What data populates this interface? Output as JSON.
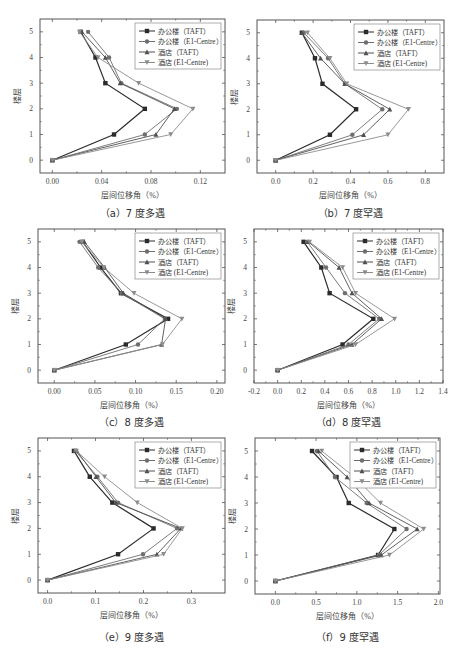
{
  "series_names": [
    "办公楼（TAFT）",
    "办公楼（E1-Centre）",
    "酒店（TAFT）",
    "酒店 (E1-Centre)"
  ],
  "series_colors": [
    "#2b2b2b",
    "#6e6e6e",
    "#505050",
    "#8c8c8c"
  ],
  "series_markers": [
    "square",
    "circle",
    "triangle-up",
    "triangle-down"
  ],
  "chart_data": [
    {
      "id": "a",
      "type": "line",
      "caption": "（a）7 度多遇",
      "title": "",
      "xlabel": "层间位移角（%）",
      "ylabel": "楼层",
      "xlim": [
        -0.01,
        0.14
      ],
      "ylim": [
        -0.5,
        5.5
      ],
      "xticks": [
        0.0,
        0.04,
        0.08,
        0.12
      ],
      "xtick_labels": [
        "0.00",
        "0.04",
        "0.08",
        "0.12"
      ],
      "yticks": [
        0,
        1,
        2,
        3,
        4,
        5
      ],
      "y": [
        0,
        1,
        2,
        3,
        4,
        5
      ],
      "legend_position": "upper right",
      "grid": false,
      "series": [
        {
          "name": "办公楼（TAFT）",
          "values": [
            0,
            0.05,
            0.075,
            0.043,
            0.035,
            0.023
          ]
        },
        {
          "name": "办公楼（E1-Centre）",
          "values": [
            0,
            0.075,
            0.101,
            0.056,
            0.046,
            0.029
          ]
        },
        {
          "name": "酒店（TAFT）",
          "values": [
            0,
            0.084,
            0.099,
            0.055,
            0.043,
            0.024
          ]
        },
        {
          "name": "酒店 (E1-Centre)",
          "values": [
            0,
            0.096,
            0.114,
            0.07,
            0.037,
            0.022
          ]
        }
      ]
    },
    {
      "id": "b",
      "type": "line",
      "caption": "（b）7 度罕遇",
      "title": "",
      "xlabel": "层间位移角（%）",
      "ylabel": "楼层",
      "xlim": [
        -0.1,
        0.9
      ],
      "ylim": [
        -0.5,
        5.5
      ],
      "xticks": [
        0.0,
        0.2,
        0.4,
        0.6,
        0.8
      ],
      "xtick_labels": [
        "0.0",
        "0.2",
        "0.4",
        "0.6",
        "0.8"
      ],
      "yticks": [
        0,
        1,
        2,
        3,
        4,
        5
      ],
      "y": [
        0,
        1,
        2,
        3,
        4,
        5
      ],
      "legend_position": "upper right",
      "grid": false,
      "series": [
        {
          "name": "办公楼（TAFT）",
          "values": [
            0,
            0.29,
            0.43,
            0.25,
            0.21,
            0.14
          ]
        },
        {
          "name": "办公楼（E1-Centre）",
          "values": [
            0,
            0.41,
            0.57,
            0.37,
            0.28,
            0.15
          ]
        },
        {
          "name": "酒店（TAFT）",
          "values": [
            0,
            0.47,
            0.61,
            0.37,
            0.24,
            0.14
          ]
        },
        {
          "name": "酒店 (E1-Centre)",
          "values": [
            0,
            0.6,
            0.71,
            0.38,
            0.29,
            0.17
          ]
        }
      ]
    },
    {
      "id": "c",
      "type": "line",
      "caption": "（c）8 度多遇",
      "title": "",
      "xlabel": "层间位移角（%）",
      "ylabel": "楼层",
      "xlim": [
        -0.02,
        0.21
      ],
      "ylim": [
        -0.5,
        5.5
      ],
      "xticks": [
        0.0,
        0.05,
        0.1,
        0.15,
        0.2
      ],
      "xtick_labels": [
        "0.00",
        "0.05",
        "0.10",
        "0.15",
        "0.20"
      ],
      "yticks": [
        0,
        1,
        2,
        3,
        4,
        5
      ],
      "y": [
        0,
        1,
        2,
        3,
        4,
        5
      ],
      "legend_position": "upper right",
      "grid": false,
      "series": [
        {
          "name": "办公楼（TAFT）",
          "values": [
            0,
            0.088,
            0.14,
            0.082,
            0.057,
            0.035
          ]
        },
        {
          "name": "办公楼（E1-Centre）",
          "values": [
            0,
            0.103,
            0.136,
            0.083,
            0.054,
            0.031
          ]
        },
        {
          "name": "酒店（TAFT）",
          "values": [
            0,
            0.132,
            0.137,
            0.085,
            0.062,
            0.037
          ]
        },
        {
          "name": "酒店 (E1-Centre)",
          "values": [
            0,
            0.133,
            0.157,
            0.098,
            0.061,
            0.034
          ]
        }
      ]
    },
    {
      "id": "d",
      "type": "line",
      "caption": "（d）8 度罕遇",
      "title": "",
      "xlabel": "层间位移角（%）",
      "ylabel": "楼层",
      "xlim": [
        -0.2,
        1.4
      ],
      "ylim": [
        -0.5,
        5.5
      ],
      "xticks": [
        -0.2,
        0.0,
        0.2,
        0.4,
        0.6,
        0.8,
        1.0,
        1.2,
        1.4
      ],
      "xtick_labels": [
        "-0.2",
        "0.0",
        "0.2",
        "0.4",
        "0.6",
        "0.8",
        "1.0",
        "1.2",
        "1.4"
      ],
      "yticks": [
        0,
        1,
        2,
        3,
        4,
        5
      ],
      "y": [
        0,
        1,
        2,
        3,
        4,
        5
      ],
      "legend_position": "upper right",
      "grid": false,
      "series": [
        {
          "name": "办公楼（TAFT）",
          "values": [
            0,
            0.55,
            0.81,
            0.44,
            0.37,
            0.22
          ]
        },
        {
          "name": "办公楼（E1-Centre）",
          "values": [
            0,
            0.6,
            0.86,
            0.57,
            0.41,
            0.25
          ]
        },
        {
          "name": "酒店（TAFT）",
          "values": [
            0,
            0.63,
            0.88,
            0.63,
            0.52,
            0.26
          ]
        },
        {
          "name": "酒店 (E1-Centre)",
          "values": [
            0,
            0.66,
            0.99,
            0.66,
            0.55,
            0.27
          ]
        }
      ]
    },
    {
      "id": "e",
      "type": "line",
      "caption": "（e）9 度多遇",
      "title": "",
      "xlabel": "层间位移角（%）",
      "ylabel": "楼层",
      "xlim": [
        -0.02,
        0.37
      ],
      "ylim": [
        -0.5,
        5.5
      ],
      "xticks": [
        0.0,
        0.1,
        0.2,
        0.3
      ],
      "xtick_labels": [
        "0.0",
        "0.1",
        "0.2",
        "0.3"
      ],
      "yticks": [
        0,
        1,
        2,
        3,
        4,
        5
      ],
      "y": [
        0,
        1,
        2,
        3,
        4,
        5
      ],
      "legend_position": "upper right",
      "grid": false,
      "series": [
        {
          "name": "办公楼（TAFT）",
          "values": [
            0,
            0.147,
            0.221,
            0.135,
            0.088,
            0.055
          ]
        },
        {
          "name": "办公楼（E1-Centre）",
          "values": [
            0,
            0.199,
            0.27,
            0.147,
            0.104,
            0.058
          ]
        },
        {
          "name": "酒店（TAFT）",
          "values": [
            0,
            0.228,
            0.278,
            0.142,
            0.101,
            0.061
          ]
        },
        {
          "name": "酒店 (E1-Centre)",
          "values": [
            0,
            0.242,
            0.281,
            0.187,
            0.119,
            0.06
          ]
        }
      ]
    },
    {
      "id": "f",
      "type": "line",
      "caption": "（f）9 度罕遇",
      "title": "",
      "xlabel": "层间位移角（%）",
      "ylabel": "楼层",
      "xlim": [
        -0.25,
        2.02
      ],
      "ylim": [
        -0.5,
        5.5
      ],
      "xticks": [
        0.0,
        0.5,
        1.0,
        1.5,
        2.0
      ],
      "xtick_labels": [
        "0.0",
        "0.5",
        "1.0",
        "1.5",
        "2.0"
      ],
      "yticks": [
        0,
        1,
        2,
        3,
        4,
        5
      ],
      "y": [
        0,
        1,
        2,
        3,
        4,
        5
      ],
      "legend_position": "upper right",
      "grid": false,
      "series": [
        {
          "name": "办公楼（TAFT）",
          "values": [
            0,
            1.26,
            1.46,
            0.9,
            0.75,
            0.45
          ]
        },
        {
          "name": "办公楼（E1-Centre）",
          "values": [
            0,
            1.27,
            1.61,
            1.12,
            0.73,
            0.51
          ]
        },
        {
          "name": "酒店（TAFT）",
          "values": [
            0,
            1.3,
            1.74,
            1.15,
            0.88,
            0.53
          ]
        },
        {
          "name": "酒店 (E1-Centre)",
          "values": [
            0,
            1.4,
            1.82,
            1.29,
            0.97,
            0.57
          ]
        }
      ]
    }
  ],
  "layout": {
    "panels": [
      {
        "id": "a",
        "frame": [
          40,
          19,
          225,
          173
        ],
        "caption_y": 205,
        "caption_x": 40
      },
      {
        "id": "b",
        "frame": [
          257,
          20,
          444,
          173
        ],
        "caption_y": 205,
        "caption_x": 257
      },
      {
        "id": "c",
        "frame": [
          38,
          229,
          225,
          383
        ],
        "caption_y": 414,
        "caption_x": 38
      },
      {
        "id": "d",
        "frame": [
          254,
          229,
          443,
          383
        ],
        "caption_y": 414,
        "caption_x": 254
      },
      {
        "id": "e",
        "frame": [
          38,
          438,
          225,
          593
        ],
        "caption_y": 629,
        "caption_x": 38
      },
      {
        "id": "f",
        "frame": [
          255,
          438,
          440,
          594
        ],
        "caption_y": 629,
        "caption_x": 255
      }
    ]
  }
}
